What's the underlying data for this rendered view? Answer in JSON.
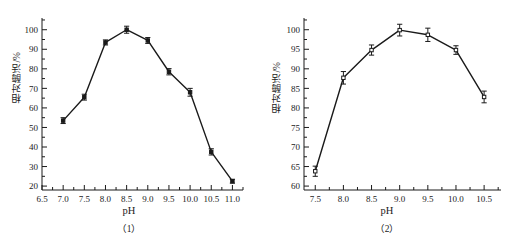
{
  "figure": {
    "background": "#ffffff",
    "ink_color": "#1a1a1a"
  },
  "panels": [
    {
      "id": "panel-1",
      "caption": "（1）",
      "xlabel": "pH",
      "ylabel": "相对酶活/%"
    },
    {
      "id": "panel-2",
      "caption": "（2）",
      "xlabel": "pH",
      "ylabel": "相对酶活/%"
    }
  ],
  "chart_data": [
    {
      "type": "line",
      "title": "",
      "subtitle": "",
      "caption": "（1）",
      "xlabel": "pH",
      "ylabel": "相对酶活/%",
      "marker": "filled-square",
      "grid": false,
      "legend": null,
      "xlim": [
        6.5,
        11.25
      ],
      "ylim": [
        18,
        106
      ],
      "xticks": [
        6.5,
        7.0,
        7.5,
        8.0,
        8.5,
        9.0,
        9.5,
        10.0,
        10.5,
        11.0
      ],
      "xticklabels": [
        "6.5",
        "7.0",
        "7.5",
        "8.0",
        "8.5",
        "9.0",
        "9.5",
        "10.0",
        "10.5",
        "11.0"
      ],
      "yticks": [
        20,
        30,
        40,
        50,
        60,
        70,
        80,
        90,
        100
      ],
      "yticklabels": [
        "20",
        "30",
        "40",
        "50",
        "60",
        "70",
        "80",
        "90",
        "100"
      ],
      "y_minor_ticks": [
        25,
        35,
        45,
        55,
        65,
        75,
        85,
        95,
        105
      ],
      "x": [
        7.0,
        7.5,
        8.0,
        8.5,
        9.0,
        9.5,
        10.0,
        10.5,
        11.0
      ],
      "values": [
        53.5,
        65.5,
        93.5,
        100.0,
        94.5,
        78.5,
        68.0,
        37.5,
        22.5
      ],
      "errors": [
        1.5,
        1.5,
        1.3,
        1.8,
        1.5,
        1.6,
        2.0,
        1.6,
        1.0
      ]
    },
    {
      "type": "line",
      "title": "",
      "subtitle": "",
      "caption": "（2）",
      "xlabel": "pH",
      "ylabel": "相对酶活/%",
      "marker": "open-square",
      "grid": false,
      "legend": null,
      "xlim": [
        7.3,
        10.8
      ],
      "ylim": [
        59,
        103
      ],
      "xticks": [
        7.5,
        8.0,
        8.5,
        9.0,
        9.5,
        10.0,
        10.5
      ],
      "xticklabels": [
        "7.5",
        "8.0",
        "8.5",
        "9.0",
        "9.5",
        "10.0",
        "10.5"
      ],
      "yticks": [
        60,
        65,
        70,
        75,
        80,
        85,
        90,
        95,
        100
      ],
      "yticklabels": [
        "60",
        "65",
        "70",
        "75",
        "80",
        "85",
        "90",
        "95",
        "100"
      ],
      "y_minor_ticks": [
        62.5,
        67.5,
        72.5,
        77.5,
        82.5,
        87.5,
        92.5,
        97.5,
        102.5
      ],
      "x": [
        7.5,
        8.0,
        8.5,
        9.0,
        9.5,
        10.0,
        10.5
      ],
      "values": [
        63.8,
        87.7,
        94.8,
        99.9,
        98.7,
        94.8,
        82.8
      ],
      "errors": [
        1.3,
        1.6,
        1.3,
        1.5,
        1.7,
        1.1,
        1.5
      ]
    }
  ]
}
